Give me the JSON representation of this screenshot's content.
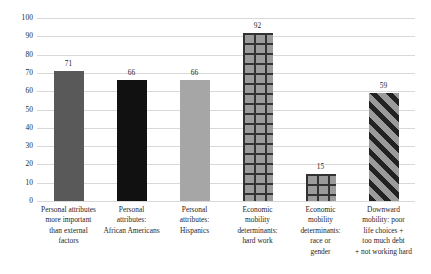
{
  "chart_data": {
    "type": "bar",
    "title": "",
    "subtitle": "",
    "xlabel": "",
    "ylabel": "",
    "ylim": [
      0,
      100
    ],
    "ytick_step": 10,
    "yticks": [
      100,
      90,
      80,
      70,
      60,
      50,
      40,
      30,
      20,
      10,
      0
    ],
    "grid": "horizontal",
    "legend": "none",
    "categories": [
      "Personal attributes more important than external factors",
      "Personal attributes: African Americans",
      "Personal attributes: Hispanics",
      "Economic mobility determinants: hard work",
      "Economic mobility determinants: race or gender",
      "Downward mobility: poor life choices + too much debt + not working hard"
    ],
    "category_lines": [
      [
        "Personal attributes",
        "more important",
        "than external",
        "factors"
      ],
      [
        "Personal",
        "attributes:",
        "African Americans"
      ],
      [
        "Personal",
        "attributes:",
        "Hispanics"
      ],
      [
        "Economic",
        "mobility",
        "determinants:",
        "hard work"
      ],
      [
        "Economic",
        "mobility",
        "determinants:",
        "race or",
        "gender"
      ],
      [
        "Downward",
        "mobility: poor",
        "life choices +",
        "too much debt",
        "+ not working hard"
      ]
    ],
    "values": [
      71,
      66,
      66,
      92,
      15,
      59
    ],
    "value_labels": [
      "71",
      "66",
      "66",
      "92",
      "15",
      "59"
    ],
    "bar_fills": [
      "dark-gray-solid",
      "black-solid",
      "light-gray-solid",
      "gray-crosshatch",
      "gray-crosshatch",
      "gray-diagonal-stripes"
    ],
    "colors": {
      "dark_gray": "#595959",
      "black": "#111111",
      "light_gray": "#a6a6a6",
      "pattern_base_gray": "#9b9b9b",
      "pattern_line_dark": "#333333",
      "gridline": "#d9d9d9",
      "text": "#1f1f1f",
      "background": "#ffffff"
    }
  }
}
